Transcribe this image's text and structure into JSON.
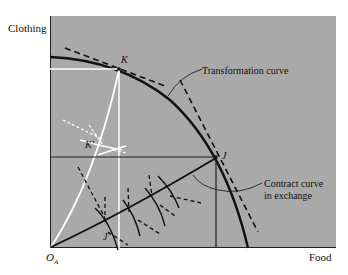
{
  "figure": {
    "y_axis_label": "Clothing",
    "x_axis_label": "Food",
    "origin_label": "O",
    "origin_subscript": "A",
    "points": {
      "K": "K",
      "J": "J",
      "K_prime": "K′",
      "J_prime": "J′"
    },
    "annotations": {
      "transformation_curve": "Transformation curve",
      "contract_curve_line1": "Contract curve",
      "contract_curve_line2": "in exchange"
    },
    "colors": {
      "background": "#a9a9a9",
      "curve": "#111111",
      "white_box": "#ffffff"
    }
  }
}
